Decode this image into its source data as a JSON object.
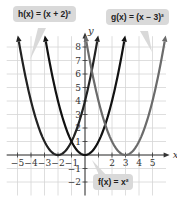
{
  "chart_data": {
    "type": "line",
    "title": "",
    "xlabel": "x",
    "ylabel": "y",
    "xlim": [
      -5.8,
      6
    ],
    "ylim": [
      -3,
      8.8
    ],
    "x_ticks": [
      -5,
      -4,
      -3,
      -2,
      -1,
      1,
      2,
      3,
      4,
      5
    ],
    "x_tick_labels": [
      "−5",
      "−4",
      "−3",
      "−2",
      "−1",
      "",
      "2",
      "3",
      "4",
      "5"
    ],
    "y_ticks": [
      -2,
      -1,
      1,
      2,
      3,
      4,
      5,
      6,
      7,
      8
    ],
    "y_tick_labels": [
      "−2",
      "−1",
      "1",
      "2",
      "3",
      "4",
      "5",
      "6",
      "7",
      "8"
    ],
    "grid": true,
    "legend": "none",
    "series": [
      {
        "name": "h(x) = (x + 2)²",
        "color": "#222222",
        "vertex": [
          -2,
          0
        ],
        "domain": [
          -4.9,
          0.9
        ]
      },
      {
        "name": "f(x) = x²",
        "color": "#111111",
        "vertex": [
          0,
          0
        ],
        "domain": [
          -2.9,
          2.9
        ]
      },
      {
        "name": "g(x) = (x − 3)²",
        "color": "#6b6b6b",
        "vertex": [
          3,
          0
        ],
        "domain": [
          0.1,
          5.9
        ]
      }
    ],
    "annotations": [
      {
        "text": "h(x) = (x + 2)²",
        "position": "top-left"
      },
      {
        "text": "g(x) = (x − 3)²",
        "position": "top-right"
      },
      {
        "text": "f(x) = x²",
        "position": "bottom-center"
      }
    ]
  },
  "labels": {
    "h": "h(x) = (x + 2)²",
    "g": "g(x) = (x − 3)²",
    "f": "f(x) = x²",
    "x_axis": "x",
    "y_axis": "y"
  }
}
